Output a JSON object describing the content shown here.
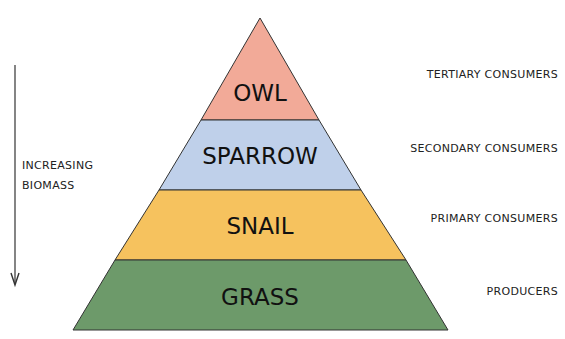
{
  "diagram": {
    "type": "ecological-pyramid",
    "axis": {
      "label_line1": "INCREASING",
      "label_line2": "BIOMASS",
      "direction": "down"
    },
    "tiers": [
      {
        "organism": "OWL",
        "level": "TERTIARY CONSUMERS",
        "color": "#f2aa98"
      },
      {
        "organism": "SPARROW",
        "level": "SECONDARY CONSUMERS",
        "color": "#bfd0ea"
      },
      {
        "organism": "SNAIL",
        "level": "PRIMARY CONSUMERS",
        "color": "#f6c25e"
      },
      {
        "organism": "GRASS",
        "level": "PRODUCERS",
        "color": "#6d9a6a"
      }
    ]
  }
}
